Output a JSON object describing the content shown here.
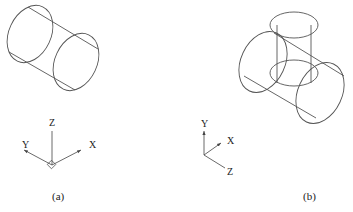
{
  "figure_a": {
    "caption": "(a)",
    "axes": {
      "z": "Z",
      "y": "Y",
      "x": "X"
    }
  },
  "figure_b": {
    "caption": "(b)",
    "axes": {
      "y": "Y",
      "x": "X",
      "z": "Z"
    }
  },
  "colors": {
    "line": "#555555",
    "text": "#222222",
    "background": "#ffffff"
  }
}
